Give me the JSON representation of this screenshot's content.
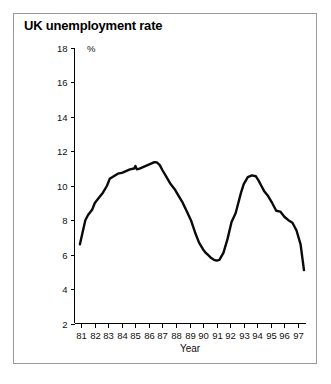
{
  "figure": {
    "title": "UK unemployment rate",
    "border_color": "#9a9a9a",
    "background": "#ffffff"
  },
  "chart_data": {
    "type": "line",
    "title": "UK unemployment rate",
    "xlabel": "Year",
    "ylabel": "%",
    "y_unit_label": "%",
    "xlim": [
      80.5,
      97.6
    ],
    "ylim": [
      2,
      18
    ],
    "grid": false,
    "legend": null,
    "line_color": "#0a0a0a",
    "x_tick_labels": [
      "81",
      "82",
      "83",
      "84",
      "85",
      "86",
      "87",
      "88",
      "89",
      "90",
      "91",
      "92",
      "93",
      "94",
      "95",
      "96",
      "97"
    ],
    "x_ticks": [
      81,
      82,
      83,
      84,
      85,
      86,
      87,
      88,
      89,
      90,
      91,
      92,
      93,
      94,
      95,
      96,
      97
    ],
    "y_tick_labels": [
      "2",
      "4",
      "6",
      "8",
      "10",
      "12",
      "14",
      "16",
      "18"
    ],
    "y_ticks": [
      2,
      4,
      6,
      8,
      10,
      12,
      14,
      16,
      18
    ],
    "series": [
      {
        "name": "UK unemployment rate",
        "x": [
          80.9,
          81.1,
          81.3,
          81.5,
          81.8,
          82.0,
          82.3,
          82.6,
          82.9,
          83.1,
          83.4,
          83.7,
          84.0,
          84.3,
          84.6,
          84.9,
          85.0,
          85.1,
          85.3,
          85.6,
          85.9,
          86.2,
          86.4,
          86.6,
          86.8,
          87.0,
          87.3,
          87.6,
          87.9,
          88.2,
          88.5,
          88.8,
          89.1,
          89.4,
          89.7,
          90.0,
          90.2,
          90.4,
          90.6,
          90.8,
          91.0,
          91.2,
          91.5,
          91.8,
          92.1,
          92.4,
          92.6,
          92.8,
          93.0,
          93.3,
          93.6,
          93.9,
          94.1,
          94.3,
          94.5,
          94.8,
          95.1,
          95.4,
          95.7,
          96.0,
          96.3,
          96.6,
          96.9,
          97.2,
          97.45
        ],
        "y": [
          6.6,
          7.3,
          8.0,
          8.3,
          8.6,
          9.0,
          9.3,
          9.6,
          10.0,
          10.4,
          10.55,
          10.7,
          10.75,
          10.85,
          10.95,
          11.0,
          11.15,
          10.95,
          11.0,
          11.1,
          11.2,
          11.3,
          11.37,
          11.35,
          11.2,
          10.9,
          10.5,
          10.1,
          9.8,
          9.4,
          9.0,
          8.5,
          8.0,
          7.3,
          6.7,
          6.3,
          6.1,
          5.95,
          5.8,
          5.7,
          5.65,
          5.7,
          6.1,
          6.9,
          7.9,
          8.4,
          9.0,
          9.6,
          10.1,
          10.5,
          10.6,
          10.55,
          10.3,
          10.0,
          9.7,
          9.4,
          9.0,
          8.55,
          8.5,
          8.2,
          8.0,
          7.85,
          7.4,
          6.6,
          5.1
        ]
      }
    ]
  }
}
